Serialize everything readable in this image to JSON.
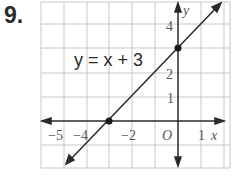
{
  "problem_number": "9.",
  "equation_label": "y = x + 3",
  "axes": {
    "x_label": "x",
    "y_label": "y",
    "origin_label": "O",
    "x_ticks": [
      "−5",
      "−4",
      "−2",
      "1"
    ],
    "y_ticks": [
      "4",
      "2",
      "1"
    ]
  },
  "points": [
    {
      "label": "y-intercept",
      "x": 0,
      "y": 3
    },
    {
      "label": "x-intercept",
      "x": -3,
      "y": 0
    }
  ],
  "colors": {
    "line": "#2a2a2a",
    "grid": "#c8c8c8",
    "text": "#555555"
  }
}
